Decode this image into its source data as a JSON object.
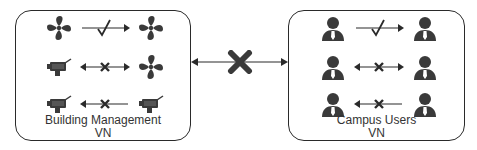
{
  "diagram": {
    "left_vn": {
      "title_line1": "Building Management",
      "title_line2": "VN",
      "rows": [
        {
          "from_icon": "fan-icon",
          "to_icon": "fan-icon",
          "arrow": "unidirectional-right",
          "status": "allowed",
          "mark": "check"
        },
        {
          "from_icon": "camera-icon",
          "to_icon": "fan-icon",
          "arrow": "bidirectional",
          "status": "blocked",
          "mark": "cross"
        },
        {
          "from_icon": "camera-icon",
          "to_icon": "camera-icon",
          "arrow": "unidirectional-left",
          "status": "blocked",
          "mark": "cross"
        }
      ]
    },
    "right_vn": {
      "title_line1": "Campus Users",
      "title_line2": "VN",
      "rows": [
        {
          "from_icon": "user-icon",
          "to_icon": "user-icon",
          "arrow": "unidirectional-right",
          "status": "allowed",
          "mark": "check"
        },
        {
          "from_icon": "user-icon",
          "to_icon": "user-icon",
          "arrow": "bidirectional",
          "status": "blocked",
          "mark": "cross"
        },
        {
          "from_icon": "user-icon",
          "to_icon": "user-icon",
          "arrow": "unidirectional-left",
          "status": "blocked",
          "mark": "cross"
        }
      ]
    },
    "inter_vn_link": {
      "arrow": "bidirectional",
      "status": "blocked",
      "mark": "cross"
    },
    "colors": {
      "icon": "#3a3a3a",
      "line": "#2a2a2a",
      "text": "#333333",
      "tie": "#ffffff"
    }
  }
}
